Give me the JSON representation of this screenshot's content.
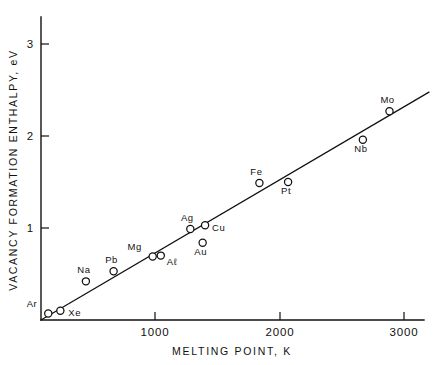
{
  "chart_data": {
    "type": "scatter",
    "title": "",
    "xlabel": "MELTING POINT, K",
    "ylabel": "VACANCY FORMATION ENTHALPY, eV",
    "xlim": [
      0,
      3230
    ],
    "ylim": [
      0,
      3.15
    ],
    "xticks": [
      1000,
      2000,
      3000
    ],
    "xticklabels": [
      "1000",
      "2000",
      "3000"
    ],
    "yticks": [
      1,
      2,
      3
    ],
    "yticklabels": [
      "1",
      "2",
      "3"
    ],
    "grid": false,
    "legend": "none",
    "marker": "open-circle",
    "points": [
      {
        "label": "Ar",
        "x": 60,
        "y": 0.07,
        "label_dx": -11,
        "label_dy": -7
      },
      {
        "label": "Xe",
        "x": 160,
        "y": 0.1,
        "label_dx": 8,
        "label_dy": 5
      },
      {
        "label": "Na",
        "x": 371,
        "y": 0.42,
        "label_dx": -2,
        "label_dy": -8
      },
      {
        "label": "Pb",
        "x": 600,
        "y": 0.53,
        "label_dx": -2,
        "label_dy": -8
      },
      {
        "label": "Mg",
        "x": 923,
        "y": 0.69,
        "label_dx": -11,
        "label_dy": -7
      },
      {
        "label": "Aℓ",
        "x": 990,
        "y": 0.7,
        "label_dx": 6,
        "label_dy": 9
      },
      {
        "label": "Ag",
        "x": 1234,
        "y": 0.99,
        "label_dx": -3,
        "label_dy": -8
      },
      {
        "label": "Cu",
        "x": 1356,
        "y": 1.03,
        "label_dx": 7,
        "label_dy": 6
      },
      {
        "label": "Au",
        "x": 1336,
        "y": 0.84,
        "label_dx": -2,
        "label_dy": 12
      },
      {
        "label": "Fe",
        "x": 1805,
        "y": 1.49,
        "label_dx": -3,
        "label_dy": -8
      },
      {
        "label": "Pt",
        "x": 2042,
        "y": 1.5,
        "label_dx": -2,
        "label_dy": 12
      },
      {
        "label": "Nb",
        "x": 2660,
        "y": 1.96,
        "label_dx": -2,
        "label_dy": 12
      },
      {
        "label": "Mo",
        "x": 2880,
        "y": 2.27,
        "label_dx": -2,
        "label_dy": -8
      }
    ],
    "fit_line": {
      "name": "linear trend",
      "x_start": 0,
      "y_start": 0.0,
      "x_end": 3210,
      "y_end": 2.48
    }
  }
}
